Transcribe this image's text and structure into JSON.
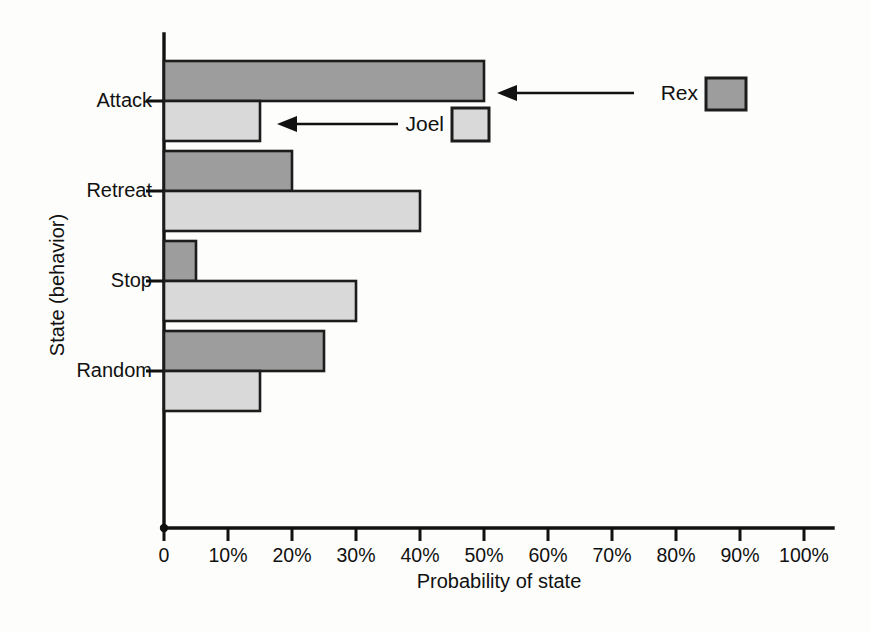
{
  "chart_data": {
    "type": "bar",
    "orientation": "horizontal",
    "title": "",
    "xlabel": "Probability of state",
    "ylabel": "State (behavior)",
    "categories": [
      "Attack",
      "Retreat",
      "Stop",
      "Random"
    ],
    "series": [
      {
        "name": "Rex",
        "color": "#9d9d9d",
        "values": [
          50,
          20,
          5,
          25
        ]
      },
      {
        "name": "Joel",
        "color": "#d9d9d9",
        "values": [
          15,
          40,
          30,
          15
        ]
      }
    ],
    "xlim": [
      0,
      100
    ],
    "xtick_labels": [
      "0",
      "10%",
      "20%",
      "30%",
      "40%",
      "50%",
      "60%",
      "70%",
      "80%",
      "90%",
      "100%"
    ],
    "xtick_values": [
      0,
      10,
      20,
      30,
      40,
      50,
      60,
      70,
      80,
      90,
      100
    ],
    "grid": false,
    "legend_position": "inline-annotations",
    "annotations": [
      {
        "label": "Rex",
        "points_to": "Attack / Rex bar end",
        "swatch_color": "#9d9d9d"
      },
      {
        "label": "Joel",
        "points_to": "Attack / Joel bar end",
        "swatch_color": "#d9d9d9"
      }
    ]
  },
  "colors": {
    "rex": "#9d9d9d",
    "joel": "#d9d9d9",
    "ink": "#111111",
    "background": "#fdfdfb"
  }
}
